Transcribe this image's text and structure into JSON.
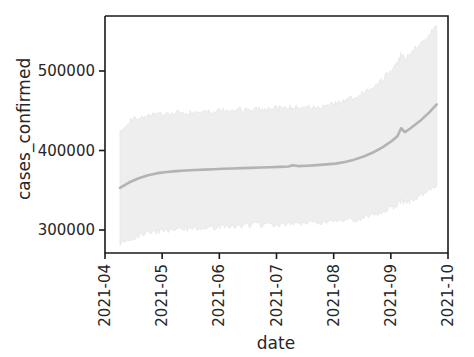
{
  "chart": {
    "type": "line",
    "title": "",
    "xlabel": "date",
    "ylabel": "cases_confirmed",
    "x_tick_labels": [
      "2021-04",
      "2021-05",
      "2021-06",
      "2021-07",
      "2021-08",
      "2021-09",
      "2021-10"
    ],
    "y_tick_labels": [
      "300000",
      "400000",
      "500000"
    ],
    "y_tick_values": [
      300000,
      400000,
      500000
    ],
    "line_color": "#b3b3b3",
    "band_color": "#eeeeee",
    "axis_color": "#1a1a1a",
    "text_color": "#262626",
    "grid": false,
    "legend": "none"
  },
  "chart_data": {
    "type": "line",
    "title": "",
    "xlabel": "date",
    "ylabel": "cases_confirmed",
    "xlim": [
      "2021-04-01",
      "2021-10-01"
    ],
    "ylim": [
      270000,
      565000
    ],
    "ytick_values": [
      300000,
      500000
    ],
    "ytick_labels": [
      "300000",
      "400000",
      "500000"
    ],
    "xtick_labels": [
      "2021-04",
      "2021-05",
      "2021-06",
      "2021-07",
      "2021-08",
      "2021-09",
      "2021-10"
    ],
    "grid": false,
    "legend_position": "none",
    "series": [
      {
        "name": "cases_confirmed",
        "kind": "line_with_band",
        "line_color": "#b3b3b3",
        "band_color": "#eeeeee",
        "x": [
          "2021-04-09",
          "2021-04-14",
          "2021-04-19",
          "2021-04-24",
          "2021-04-29",
          "2021-05-04",
          "2021-05-09",
          "2021-05-14",
          "2021-05-19",
          "2021-05-24",
          "2021-05-29",
          "2021-06-03",
          "2021-06-08",
          "2021-06-13",
          "2021-06-18",
          "2021-06-23",
          "2021-06-28",
          "2021-07-03",
          "2021-07-08",
          "2021-07-10",
          "2021-07-13",
          "2021-07-18",
          "2021-07-23",
          "2021-07-28",
          "2021-08-02",
          "2021-08-07",
          "2021-08-12",
          "2021-08-17",
          "2021-08-22",
          "2021-08-27",
          "2021-09-01",
          "2021-09-04",
          "2021-09-06",
          "2021-09-08",
          "2021-09-11",
          "2021-09-16",
          "2021-09-21",
          "2021-09-25"
        ],
        "y": [
          353000,
          360000,
          365000,
          369000,
          371500,
          373000,
          374000,
          374800,
          375400,
          376000,
          376500,
          377000,
          377400,
          377800,
          378200,
          378600,
          379000,
          379400,
          379800,
          381500,
          380400,
          380900,
          381600,
          382500,
          383500,
          385500,
          388500,
          392500,
          397500,
          404000,
          412000,
          418000,
          428000,
          423000,
          428000,
          437000,
          448000,
          458000
        ],
        "y_upper": [
          423000,
          437000,
          441000,
          443000,
          445000,
          446000,
          447000,
          447500,
          448000,
          448500,
          449000,
          450000,
          450500,
          451000,
          451500,
          452000,
          452500,
          453000,
          453500,
          454000,
          454500,
          455000,
          456000,
          457500,
          459000,
          462000,
          467000,
          473000,
          481000,
          490000,
          501000,
          509000,
          522000,
          515000,
          522000,
          533000,
          546000,
          556000
        ],
        "y_lower": [
          283000,
          289000,
          293000,
          296000,
          298500,
          300000,
          301000,
          302000,
          302800,
          303500,
          304000,
          304500,
          305000,
          305500,
          306000,
          306500,
          307000,
          307500,
          308000,
          309500,
          308500,
          309000,
          309500,
          310000,
          310500,
          311500,
          313000,
          315000,
          318000,
          322000,
          327000,
          331000,
          337000,
          334000,
          337000,
          343000,
          350000,
          356000
        ]
      }
    ]
  }
}
